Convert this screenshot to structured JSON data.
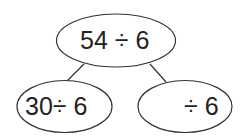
{
  "diagram": {
    "type": "number-bond",
    "root": {
      "label": "54 ÷ 6"
    },
    "children": [
      {
        "label": "30÷ 6"
      },
      {
        "label": "÷ 6",
        "blank_part": true
      }
    ]
  },
  "colors": {
    "stroke": "#333333",
    "text": "#222222",
    "background": "#ffffff"
  }
}
